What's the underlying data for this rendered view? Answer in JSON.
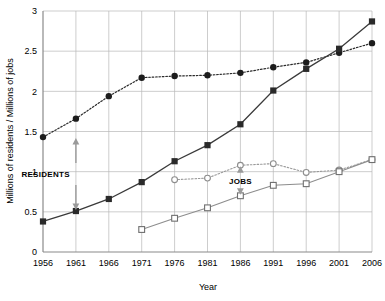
{
  "chart_data": {
    "type": "line",
    "title": "",
    "xlabel": "Year",
    "ylabel": "Millions of residents / Millions of jobs",
    "categories": [
      1956,
      1961,
      1966,
      1971,
      1976,
      1981,
      1986,
      1991,
      1996,
      2001,
      2006
    ],
    "xticklabels": [
      "1956",
      "1961",
      "1966",
      "1971",
      "1976",
      "1981",
      "1986",
      "1991",
      "1996",
      "2001",
      "2006"
    ],
    "yticklabels": [
      "0",
      "0.5",
      "1",
      "1.5",
      "2",
      "2.5",
      "3"
    ],
    "yticks": [
      0,
      0.5,
      1,
      1.5,
      2,
      2.5,
      3
    ],
    "xlim": [
      1956,
      2006
    ],
    "ylim": [
      0,
      3
    ],
    "grid": true,
    "legend": "none",
    "series": [
      {
        "name": "residents-upper",
        "marker": "filled-circle",
        "linestyle": "dotted",
        "color": "#1c1c1c",
        "x": [
          1956,
          1961,
          1966,
          1971,
          1976,
          1981,
          1986,
          1991,
          1996,
          2001,
          2006
        ],
        "values": [
          1.43,
          1.66,
          1.94,
          2.17,
          2.19,
          2.2,
          2.23,
          2.3,
          2.36,
          2.48,
          2.6
        ]
      },
      {
        "name": "residents-lower",
        "marker": "filled-square",
        "linestyle": "solid",
        "color": "#2a2a2a",
        "x": [
          1956,
          1961,
          1966,
          1971,
          1976,
          1981,
          1986,
          1991,
          1996,
          2001,
          2006
        ],
        "values": [
          0.38,
          0.51,
          0.66,
          0.87,
          1.13,
          1.33,
          1.59,
          2.01,
          2.28,
          2.53,
          2.87
        ]
      },
      {
        "name": "jobs-upper",
        "marker": "open-circle",
        "linestyle": "dotted",
        "color": "#9a9a9a",
        "x": [
          1976,
          1981,
          1986,
          1991,
          1996,
          2001,
          2006
        ],
        "values": [
          0.9,
          0.92,
          1.08,
          1.1,
          0.99,
          1.02,
          1.15
        ]
      },
      {
        "name": "jobs-lower",
        "marker": "open-square",
        "linestyle": "solid",
        "color": "#8d8d8d",
        "x": [
          1971,
          1976,
          1981,
          1986,
          1991,
          1996,
          2001,
          2006
        ],
        "values": [
          0.28,
          0.42,
          0.55,
          0.7,
          0.83,
          0.85,
          1.0,
          1.15
        ]
      }
    ],
    "annotations": [
      {
        "label": "RESIDENTS",
        "x": 1961,
        "y_top": 1.43,
        "y_bottom": 0.51,
        "style": "double-arrow"
      },
      {
        "label": "JOBS",
        "x": 1986,
        "y_top": 1.08,
        "y_bottom": 0.7,
        "style": "double-arrow"
      }
    ]
  }
}
